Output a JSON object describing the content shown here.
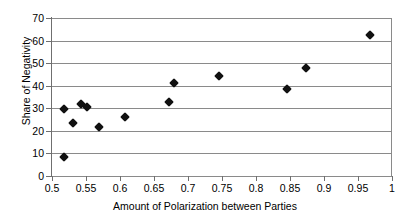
{
  "chart_data": {
    "type": "scatter",
    "title": "",
    "xlabel": "Amount of Polarization between Parties",
    "ylabel": "Share of Negativity",
    "xlim": [
      0.5,
      1
    ],
    "ylim": [
      0,
      70
    ],
    "xticks": [
      0.5,
      0.55,
      0.6,
      0.65,
      0.7,
      0.75,
      0.8,
      0.85,
      0.9,
      0.95,
      1
    ],
    "xtick_labels": [
      "0.5",
      "0.55",
      "0.6",
      "0.65",
      "0.7",
      "0.75",
      "0.8",
      "0.85",
      "0.9",
      "0.95",
      "1"
    ],
    "yticks": [
      0,
      10,
      20,
      30,
      40,
      50,
      60,
      70
    ],
    "ytick_labels": [
      "0",
      "10",
      "20",
      "30",
      "40",
      "50",
      "60",
      "70"
    ],
    "grid": "horizontal",
    "legend": "none",
    "marker": "filled-diamond",
    "marker_color": "#111111",
    "grid_color": "#8a8a8a",
    "axis_color": "#6f6f6f",
    "points": [
      {
        "x": 0.517,
        "y": 29.5
      },
      {
        "x": 0.518,
        "y": 8.5
      },
      {
        "x": 0.531,
        "y": 23.3
      },
      {
        "x": 0.542,
        "y": 31.9
      },
      {
        "x": 0.552,
        "y": 30.4
      },
      {
        "x": 0.569,
        "y": 21.8
      },
      {
        "x": 0.608,
        "y": 26.1
      },
      {
        "x": 0.672,
        "y": 33.0
      },
      {
        "x": 0.679,
        "y": 41.0
      },
      {
        "x": 0.745,
        "y": 44.1
      },
      {
        "x": 0.845,
        "y": 38.7
      },
      {
        "x": 0.874,
        "y": 48.0
      },
      {
        "x": 0.967,
        "y": 62.3
      }
    ]
  }
}
